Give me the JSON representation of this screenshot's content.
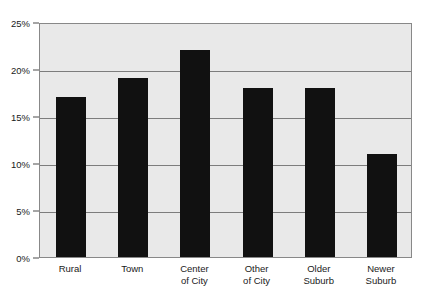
{
  "chart_data": {
    "type": "bar",
    "title": "",
    "xlabel": "",
    "ylabel": "",
    "categories": [
      "Rural",
      "Town",
      "Center\nof City",
      "Other\nof City",
      "Older\nSuburb",
      "Newer\nSuburb"
    ],
    "values": [
      17,
      19,
      22,
      18,
      18,
      11
    ],
    "ylim": [
      0,
      25
    ],
    "ytick_values": [
      0,
      5,
      10,
      15,
      20,
      25
    ],
    "ytick_labels": [
      "0%",
      "5%",
      "10%",
      "15%",
      "20%",
      "25%"
    ],
    "grid": true,
    "legend": false,
    "legend_position": "none",
    "colors": {
      "bar": "#111111",
      "plot_background": "#e9e9e9",
      "gridline": "#7d7d7d",
      "axis": "#888888",
      "text": "#1a1a1a",
      "page_background": "#ffffff"
    }
  }
}
